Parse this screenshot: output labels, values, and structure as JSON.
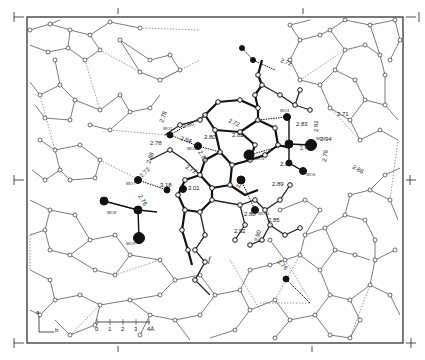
{
  "figure": {
    "type": "crystal-structure-projection",
    "frame": {
      "left": 27,
      "top": 17,
      "right": 403,
      "bottom": 343
    },
    "axis_markers": {
      "top": "1",
      "bottom": "1",
      "left_top": "1",
      "left_mid": "1",
      "left_bottom": "1",
      "right_top": "1",
      "right_mid": "1",
      "right_bottom": "1"
    },
    "axes_inset": {
      "a_label": "a",
      "b_label": "b"
    },
    "scale_bar": {
      "ticks": [
        "0",
        "1",
        "2",
        "3",
        "4Å"
      ],
      "unit": "Å"
    },
    "italic_marker": "f",
    "water_labels": [
      "WO1",
      "WO2",
      "WO3",
      "WO4",
      "WO5",
      "WO6",
      "WO7",
      "WO8",
      "WO9",
      "WO10"
    ],
    "hbond_distances": [
      {
        "label": "2.78",
        "x": 166,
        "y": 125
      },
      {
        "label": "2.78",
        "x": 152,
        "y": 143
      },
      {
        "label": "2.80",
        "x": 188,
        "y": 127
      },
      {
        "label": "2.84",
        "x": 182,
        "y": 139
      },
      {
        "label": "2.80",
        "x": 207,
        "y": 138
      },
      {
        "label": "2.75",
        "x": 200,
        "y": 153
      },
      {
        "label": "2.72",
        "x": 190,
        "y": 166
      },
      {
        "label": "2.72",
        "x": 231,
        "y": 121
      },
      {
        "label": "2.82",
        "x": 236,
        "y": 135
      },
      {
        "label": "2.72",
        "x": 283,
        "y": 60
      },
      {
        "label": "2.71",
        "x": 342,
        "y": 114
      },
      {
        "label": "2.83",
        "x": 302,
        "y": 124
      },
      {
        "label": "2.82",
        "x": 320,
        "y": 130
      },
      {
        "label": "2.94",
        "x": 327,
        "y": 144
      },
      {
        "label": "2.81",
        "x": 304,
        "y": 148
      },
      {
        "label": "2.80",
        "x": 294,
        "y": 164
      },
      {
        "label": "2.78",
        "x": 330,
        "y": 160
      },
      {
        "label": "2.86",
        "x": 356,
        "y": 166
      },
      {
        "label": "2.88",
        "x": 155,
        "y": 162
      },
      {
        "label": "3.18",
        "x": 168,
        "y": 186
      },
      {
        "label": "3.01",
        "x": 193,
        "y": 190
      },
      {
        "label": "2.72",
        "x": 148,
        "y": 176
      },
      {
        "label": "2.91",
        "x": 244,
        "y": 186
      },
      {
        "label": "2.89",
        "x": 276,
        "y": 184
      },
      {
        "label": "2.80",
        "x": 250,
        "y": 214
      },
      {
        "label": "2.85",
        "x": 274,
        "y": 220
      },
      {
        "label": "2.92",
        "x": 239,
        "y": 232
      },
      {
        "label": "2.90",
        "x": 262,
        "y": 240
      },
      {
        "label": "2.76",
        "x": 282,
        "y": 262
      },
      {
        "label": "2.76",
        "x": 118,
        "y": 198
      }
    ]
  }
}
